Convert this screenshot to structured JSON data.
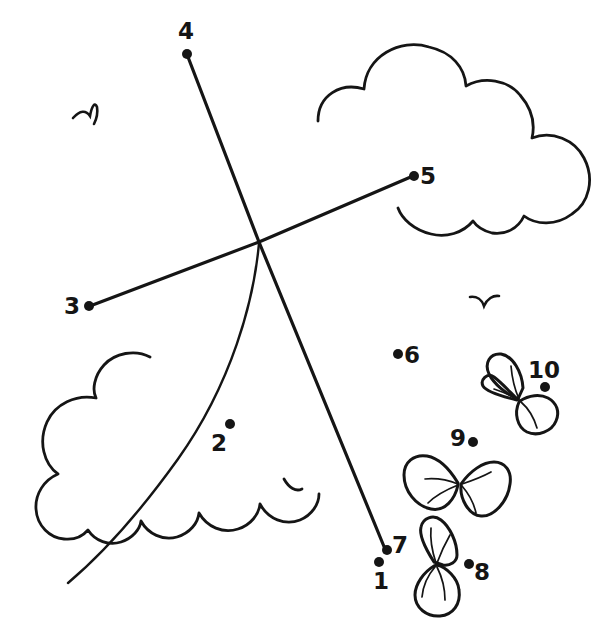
{
  "page": {
    "width": 607,
    "height": 629,
    "background_color": "#ffffff",
    "ink_color": "#151515"
  },
  "puzzle": {
    "type": "connect-the-dots",
    "dot_count": 10,
    "dots": [
      {
        "number": "1",
        "dot_x": 379,
        "dot_y": 562,
        "label_x": 373,
        "label_y": 570,
        "label_position": "below"
      },
      {
        "number": "2",
        "dot_x": 230,
        "dot_y": 424,
        "label_x": 211,
        "label_y": 432,
        "label_position": "below-left"
      },
      {
        "number": "3",
        "dot_x": 89,
        "dot_y": 306,
        "label_x": 64,
        "label_y": 295,
        "label_position": "left"
      },
      {
        "number": "4",
        "dot_x": 187,
        "dot_y": 54,
        "label_x": 178,
        "label_y": 20,
        "label_position": "above"
      },
      {
        "number": "5",
        "dot_x": 414,
        "dot_y": 176,
        "label_x": 420,
        "label_y": 165,
        "label_position": "right"
      },
      {
        "number": "6",
        "dot_x": 398,
        "dot_y": 354,
        "label_x": 404,
        "label_y": 344,
        "label_position": "right"
      },
      {
        "number": "7",
        "dot_x": 387,
        "dot_y": 550,
        "label_x": 392,
        "label_y": 534,
        "label_position": "right"
      },
      {
        "number": "8",
        "dot_x": 469,
        "dot_y": 564,
        "label_x": 474,
        "label_y": 561,
        "label_position": "right"
      },
      {
        "number": "9",
        "dot_x": 473,
        "dot_y": 442,
        "label_x": 450,
        "label_y": 427,
        "label_position": "left"
      },
      {
        "number": "10",
        "dot_x": 545,
        "dot_y": 387,
        "label_x": 528,
        "label_y": 359,
        "label_position": "above"
      }
    ]
  },
  "scene": {
    "description": "Kite flying in the sky with clouds, birds and butterflies",
    "elements": [
      {
        "name": "kite-line-3-to-5",
        "kind": "line"
      },
      {
        "name": "kite-line-4-to-1",
        "kind": "line"
      },
      {
        "name": "kite-tail-curve",
        "kind": "curve"
      },
      {
        "name": "cloud-top-right",
        "kind": "cloud"
      },
      {
        "name": "cloud-bottom-left",
        "kind": "cloud"
      },
      {
        "name": "bird-upper-left",
        "kind": "bird"
      },
      {
        "name": "bird-middle-right",
        "kind": "bird"
      },
      {
        "name": "butterfly-upper",
        "kind": "butterfly"
      },
      {
        "name": "butterfly-middle",
        "kind": "butterfly"
      },
      {
        "name": "butterfly-lower",
        "kind": "butterfly"
      }
    ]
  }
}
